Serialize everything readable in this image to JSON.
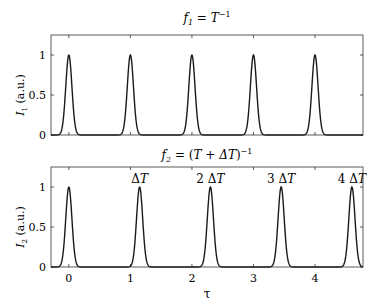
{
  "chart_data": [
    {
      "type": "line",
      "title": "f1 = T^-1",
      "title_parts": {
        "f": "f",
        "sub": "1",
        "eq": " = ",
        "T": "T",
        "sup": "−1"
      },
      "xlabel": "",
      "ylabel": "I1 (a.u.)",
      "ylabel_parts": {
        "I": "I",
        "sub": "1",
        "rest": " (a.u.)"
      },
      "xlim": [
        -0.29,
        4.78
      ],
      "ylim": [
        0,
        1.25
      ],
      "yticks": [
        "0",
        "0.5",
        "1"
      ],
      "ytick_values": [
        0,
        0.5,
        1
      ],
      "xticks_values": [
        0,
        1,
        2,
        3,
        4
      ],
      "xticks_labels_shown": false,
      "grid": false,
      "peak_centers": [
        0,
        1,
        2,
        3,
        4
      ],
      "peak_height": 1,
      "peak_sigma": 0.05
    },
    {
      "type": "line",
      "title": "f2 = (T + ΔT)^-1",
      "title_parts": {
        "f": "f",
        "sub": "2",
        "eq": " = (",
        "T": "T + ΔT",
        "close": ")",
        "sup": "−1"
      },
      "xlabel": "τ",
      "ylabel": "I2 (a.u.)",
      "ylabel_parts": {
        "I": "I",
        "sub": "2",
        "rest": " (a.u.)"
      },
      "xlim": [
        -0.29,
        4.78
      ],
      "ylim": [
        0,
        1.25
      ],
      "yticks": [
        "0",
        "0.5",
        "1"
      ],
      "ytick_values": [
        0,
        0.5,
        1
      ],
      "xticks": [
        "0",
        "1",
        "2",
        "3",
        "4"
      ],
      "xticks_values": [
        0,
        1,
        2,
        3,
        4
      ],
      "grid": false,
      "peak_centers": [
        0,
        1.15,
        2.3,
        3.45,
        4.6
      ],
      "peak_height": 1,
      "peak_sigma": 0.05,
      "annotations": [
        {
          "text": "",
          "x": 0
        },
        {
          "text": "ΔT",
          "x": 1.15
        },
        {
          "text": "2 ΔT",
          "x": 2.3
        },
        {
          "text": "3 ΔT",
          "x": 3.45
        },
        {
          "text": "4 ΔT",
          "x": 4.6
        }
      ]
    }
  ],
  "colors": {
    "line": "#1a1a1a",
    "axis": "#333333",
    "text": "#222222"
  }
}
